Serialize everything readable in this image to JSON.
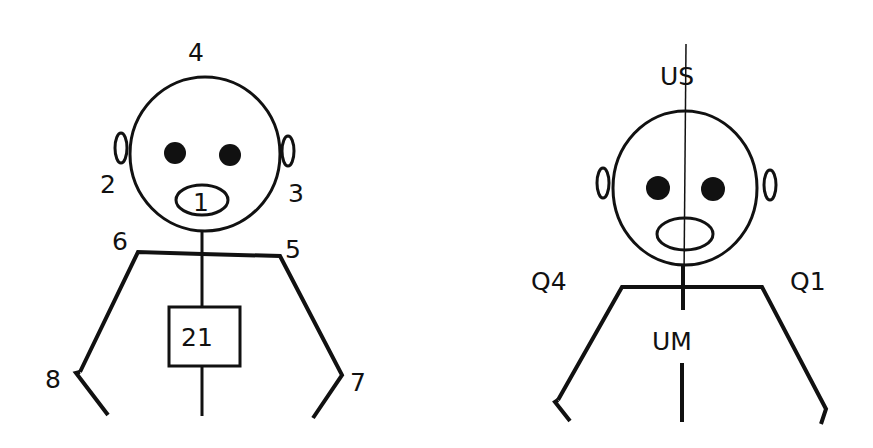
{
  "figures": [
    {
      "id": "left",
      "description": "Numbered tooth/region chart figure",
      "labels": {
        "top": "4",
        "mouth": "1",
        "left_ear": "2",
        "right_ear": "3",
        "left_shoulder": "6",
        "right_shoulder": "5",
        "left_hand": "8",
        "right_hand": "7",
        "chest_box": "21"
      }
    },
    {
      "id": "right",
      "description": "Quadrant/midline figure",
      "labels": {
        "top": "US",
        "left_shoulder": "Q4",
        "right_shoulder": "Q1",
        "torso": "UM"
      }
    }
  ],
  "colors": {
    "ink": "#111111",
    "background": "#ffffff"
  }
}
